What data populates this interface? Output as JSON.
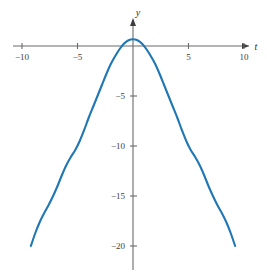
{
  "chart_data": {
    "type": "line",
    "title": "",
    "subtitle": "",
    "xlabel": "t",
    "ylabel": "y",
    "xlim": [
      -12.0,
      12.2
    ],
    "ylim": [
      -21.5,
      1.6
    ],
    "grid": false,
    "legend": null,
    "annotations": [],
    "x_ticks": [
      -10,
      -5,
      5,
      10
    ],
    "x_tick_labels": [
      "−10",
      "−5",
      "5",
      "10"
    ],
    "y_ticks": [
      -5,
      -10,
      -15,
      -20
    ],
    "y_tick_labels": [
      "−5",
      "−10",
      "−15",
      "−20"
    ],
    "series": [
      {
        "name": "curve",
        "color": "#1f77b4",
        "line_width": 2.1,
        "x": [
          -9.2,
          -8.8,
          -8.4,
          -8.0,
          -7.6,
          -7.2,
          -6.8,
          -6.4,
          -6.0,
          -5.6,
          -5.2,
          -4.8,
          -4.4,
          -4.0,
          -3.6,
          -3.2,
          -2.8,
          -2.4,
          -2.0,
          -1.6,
          -1.2,
          -0.8,
          -0.4,
          0.0,
          0.4,
          0.8,
          1.2,
          1.6,
          2.0,
          2.4,
          2.8,
          3.2,
          3.6,
          4.0,
          4.4,
          4.8,
          5.2,
          5.6,
          6.0,
          6.4,
          6.8,
          7.2,
          7.6,
          8.0,
          8.4,
          8.8,
          9.2
        ],
        "y": [
          -20.0,
          -18.7,
          -17.6,
          -16.7,
          -15.9,
          -15.0,
          -14.0,
          -12.9,
          -11.9,
          -11.1,
          -10.4,
          -9.5,
          -8.4,
          -7.2,
          -6.1,
          -5.0,
          -3.9,
          -2.8,
          -1.8,
          -1.0,
          -0.3,
          0.25,
          0.58,
          0.68,
          0.58,
          0.25,
          -0.3,
          -1.0,
          -1.8,
          -2.8,
          -3.9,
          -5.0,
          -6.1,
          -7.2,
          -8.4,
          -9.5,
          -10.4,
          -11.1,
          -11.9,
          -12.9,
          -14.0,
          -15.0,
          -15.9,
          -16.7,
          -17.6,
          -18.7,
          -20.0
        ]
      }
    ]
  },
  "axis": {
    "x_axis_name": "t",
    "y_axis_name": "y",
    "axis_color": "#6b6b6b",
    "curve_color": "#1f77b4"
  }
}
